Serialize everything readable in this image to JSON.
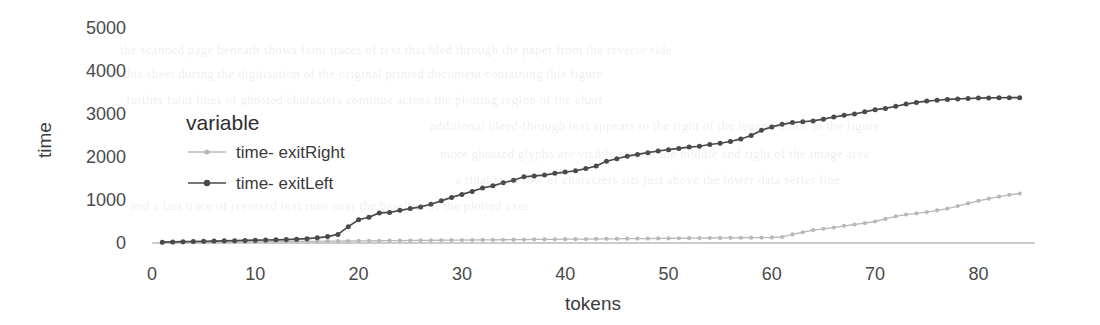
{
  "chart_data": {
    "type": "line",
    "title": "",
    "xlabel": "tokens",
    "ylabel": "time",
    "xlim": [
      0,
      85
    ],
    "ylim": [
      0,
      5000
    ],
    "xticks": [
      0,
      10,
      20,
      30,
      40,
      50,
      60,
      70,
      80
    ],
    "yticks": [
      0,
      1000,
      2000,
      3000,
      4000,
      5000
    ],
    "grid": false,
    "legend_position": "inside-upper-left",
    "legend_title": "variable",
    "markers": "filled-circle",
    "series": [
      {
        "name": "time- exitRight",
        "color": "#b8b8b8",
        "x": [
          1,
          2,
          3,
          4,
          5,
          6,
          7,
          8,
          9,
          10,
          11,
          12,
          13,
          14,
          15,
          16,
          17,
          18,
          19,
          20,
          21,
          22,
          23,
          24,
          25,
          26,
          27,
          28,
          29,
          30,
          31,
          32,
          33,
          34,
          35,
          36,
          37,
          38,
          39,
          40,
          41,
          42,
          43,
          44,
          45,
          46,
          47,
          48,
          49,
          50,
          51,
          52,
          53,
          54,
          55,
          56,
          57,
          58,
          59,
          60,
          61,
          62,
          63,
          64,
          65,
          66,
          67,
          68,
          69,
          70,
          71,
          72,
          73,
          74,
          75,
          76,
          77,
          78,
          79,
          80,
          81,
          82,
          83,
          84
        ],
        "values": [
          10,
          12,
          14,
          16,
          18,
          20,
          22,
          24,
          26,
          28,
          30,
          32,
          34,
          36,
          38,
          40,
          42,
          44,
          46,
          48,
          50,
          52,
          54,
          56,
          58,
          60,
          62,
          64,
          66,
          68,
          70,
          72,
          74,
          76,
          78,
          80,
          82,
          84,
          86,
          88,
          90,
          92,
          94,
          96,
          98,
          100,
          102,
          104,
          106,
          108,
          110,
          112,
          114,
          116,
          118,
          120,
          122,
          124,
          126,
          130,
          140,
          200,
          250,
          300,
          330,
          360,
          400,
          430,
          460,
          500,
          560,
          620,
          660,
          690,
          720,
          760,
          800,
          860,
          920,
          980,
          1030,
          1080,
          1120,
          1150
        ]
      },
      {
        "name": "time- exitLeft",
        "color": "#4a4a4a",
        "x": [
          1,
          2,
          3,
          4,
          5,
          6,
          7,
          8,
          9,
          10,
          11,
          12,
          13,
          14,
          15,
          16,
          17,
          18,
          19,
          20,
          21,
          22,
          23,
          24,
          25,
          26,
          27,
          28,
          29,
          30,
          31,
          32,
          33,
          34,
          35,
          36,
          37,
          38,
          39,
          40,
          41,
          42,
          43,
          44,
          45,
          46,
          47,
          48,
          49,
          50,
          51,
          52,
          53,
          54,
          55,
          56,
          57,
          58,
          59,
          60,
          61,
          62,
          63,
          64,
          65,
          66,
          67,
          68,
          69,
          70,
          71,
          72,
          73,
          74,
          75,
          76,
          77,
          78,
          79,
          80,
          81,
          82,
          83,
          84
        ],
        "values": [
          20,
          25,
          30,
          35,
          40,
          45,
          50,
          55,
          60,
          65,
          70,
          75,
          80,
          90,
          100,
          120,
          150,
          200,
          380,
          540,
          600,
          700,
          710,
          760,
          800,
          840,
          900,
          980,
          1060,
          1130,
          1200,
          1280,
          1330,
          1400,
          1460,
          1540,
          1560,
          1580,
          1620,
          1650,
          1680,
          1730,
          1790,
          1900,
          1960,
          2020,
          2060,
          2100,
          2140,
          2170,
          2200,
          2230,
          2250,
          2290,
          2320,
          2360,
          2420,
          2500,
          2620,
          2700,
          2760,
          2800,
          2820,
          2840,
          2880,
          2930,
          2970,
          3000,
          3050,
          3100,
          3130,
          3180,
          3230,
          3270,
          3300,
          3320,
          3340,
          3350,
          3360,
          3370,
          3375,
          3378,
          3380,
          3380
        ]
      }
    ]
  },
  "background_bleed": [
    {
      "x": 120,
      "y": 42,
      "text": "the scanned page beneath shows faint traces of text that bled through the paper from the reverse side"
    },
    {
      "x": 108,
      "y": 66,
      "text": "of this sheet during the digitisation of the original printed document containing this figure"
    },
    {
      "x": 126,
      "y": 92,
      "text": "further faint lines of ghosted characters continue across the plotting region of the chart"
    },
    {
      "x": 430,
      "y": 118,
      "text": "additional bleed-through text appears to the right of the legend block in the figure"
    },
    {
      "x": 440,
      "y": 146,
      "text": "more ghosted glyphs are visible toward the middle and right of the image area"
    },
    {
      "x": 455,
      "y": 172,
      "text": "a final faint row of characters sits just above the lower data series line"
    },
    {
      "x": 130,
      "y": 198,
      "text": "and a last trace of reversed text runs near the baseline of the plotted axes"
    }
  ]
}
